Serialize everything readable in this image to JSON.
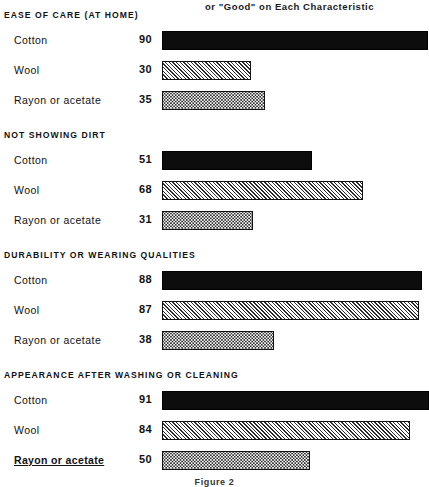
{
  "header": {
    "note": "or \"Good\" on Each Characteristic"
  },
  "figure": {
    "caption": "Figure 2"
  },
  "legend_patterns": {
    "Cotton": "solid-black",
    "Wool": "diagonal-hatch",
    "Rayon or acetate": "dotted-stipple"
  },
  "chart_data": {
    "type": "bar",
    "orientation": "horizontal",
    "title": "or \"Good\" on Each Characteristic",
    "xlabel": "",
    "ylabel": "",
    "xlim": [
      0,
      100
    ],
    "grid": false,
    "legend_position": "none",
    "categories": [
      "Cotton",
      "Wool",
      "Rayon or acetate"
    ],
    "groups": [
      {
        "name": "EASE OF CARE (AT HOME)",
        "bars": [
          {
            "label": "Cotton",
            "value": 90,
            "pattern": "solid"
          },
          {
            "label": "Wool",
            "value": 30,
            "pattern": "hatch"
          },
          {
            "label": "Rayon or acetate",
            "value": 35,
            "pattern": "dots"
          }
        ]
      },
      {
        "name": "NOT SHOWING DIRT",
        "bars": [
          {
            "label": "Cotton",
            "value": 51,
            "pattern": "solid"
          },
          {
            "label": "Wool",
            "value": 68,
            "pattern": "hatch"
          },
          {
            "label": "Rayon or acetate",
            "value": 31,
            "pattern": "dots"
          }
        ]
      },
      {
        "name": "DURABILITY OR WEARING QUALITIES",
        "bars": [
          {
            "label": "Cotton",
            "value": 88,
            "pattern": "solid"
          },
          {
            "label": "Wool",
            "value": 87,
            "pattern": "hatch"
          },
          {
            "label": "Rayon or acetate",
            "value": 38,
            "pattern": "dots"
          }
        ]
      },
      {
        "name": "APPEARANCE AFTER WASHING OR CLEANING",
        "bars": [
          {
            "label": "Cotton",
            "value": 91,
            "pattern": "solid"
          },
          {
            "label": "Wool",
            "value": 84,
            "pattern": "hatch"
          },
          {
            "label": "Rayon or acetate",
            "value": 50,
            "pattern": "dots",
            "emphasis": "underlined"
          }
        ]
      }
    ]
  }
}
